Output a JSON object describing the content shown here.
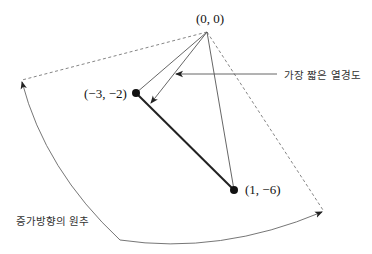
{
  "diagram": {
    "points": [
      {
        "id": "origin",
        "label": "(0, 0)",
        "x": 207,
        "y": 32
      },
      {
        "id": "a",
        "label": "(−3, −2)",
        "x": 136,
        "y": 93
      },
      {
        "id": "b",
        "label": "(1, −6)",
        "x": 234,
        "y": 190
      }
    ],
    "annotations": {
      "shortest_isoquant": "가장 짧은 열경도",
      "cone_of_increase": "증가방향의 원추"
    },
    "colors": {
      "line": "#555555",
      "thick_line": "#222222",
      "dot": "#111111",
      "dashed": "#777777",
      "text": "#111111"
    }
  }
}
